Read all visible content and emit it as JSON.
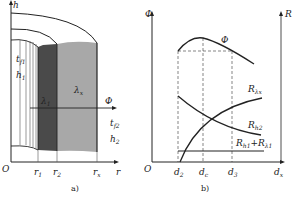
{
  "panel_a": {
    "caption": "a)",
    "axis_y": "h",
    "axis_x": "r",
    "origin": "O",
    "flux": "Φ",
    "ticks": [
      {
        "main": "r",
        "sub": "1"
      },
      {
        "main": "r",
        "sub": "2"
      },
      {
        "main": "r",
        "sub": "x"
      }
    ],
    "zone1": [
      {
        "main": "t",
        "sub": "f1"
      },
      {
        "main": "h",
        "sub": "1"
      }
    ],
    "zone2": [
      {
        "main": "t",
        "sub": "f2"
      },
      {
        "main": "h",
        "sub": "2"
      }
    ],
    "lambda1": {
      "main": "λ",
      "sub": "1"
    },
    "lambdax": {
      "main": "λ",
      "sub": "x"
    },
    "colors": {
      "dark": "#4a4a4a",
      "light": "#a8a8a8",
      "line": "#222222"
    }
  },
  "panel_b": {
    "caption": "b)",
    "axis_left": "Φ",
    "axis_right": "R",
    "axis_x": {
      "main": "d",
      "sub": "x"
    },
    "origin": "O",
    "ticks": [
      {
        "main": "d",
        "sub": "2"
      },
      {
        "main": "d",
        "sub": "c"
      },
      {
        "main": "d",
        "sub": "3"
      }
    ],
    "curves": {
      "phi": "Φ",
      "r_lx": {
        "main": "R",
        "sub": "λx"
      },
      "r_h2": {
        "main": "R",
        "sub": "h2"
      },
      "r_h1_l1": {
        "main": "R",
        "sub1": "h1",
        "plus": "+",
        "main2": "R",
        "sub2": "λ1"
      }
    }
  }
}
